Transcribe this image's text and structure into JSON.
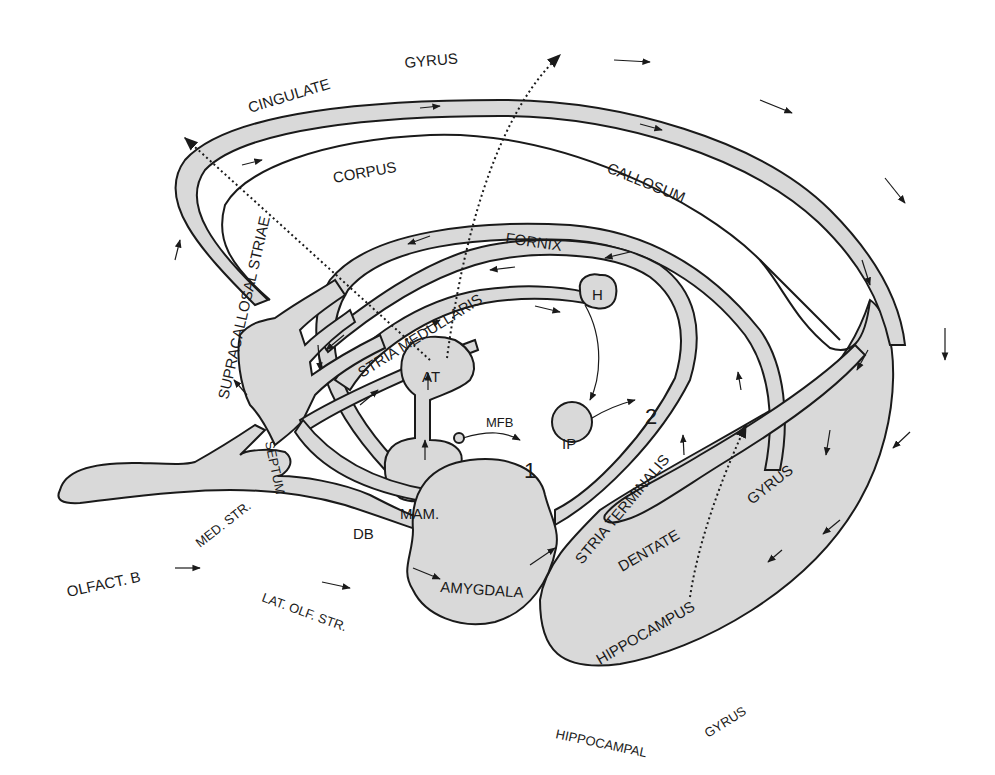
{
  "diagram": {
    "type": "anatomical-schematic",
    "labels": {
      "cingulate": "CINGULATE",
      "gyrus_top": "GYRUS",
      "corpus": "CORPUS",
      "callosum": "CALLOSUM",
      "fornix": "FORNIX",
      "stria_medullaris": "STRIA MEDULLARIS",
      "supracallosal_striae": "SUPRACALLOSAL STRIAE",
      "h": "H",
      "at": "AT",
      "mfb": "MFB",
      "ip": "IP",
      "num1": "1",
      "num2": "2",
      "septum": "SEPTUM",
      "mam": "MAM.",
      "db": "DB",
      "med_str": "MED. STR.",
      "olfact_b": "OLFACT. B",
      "lat_olf_str": "LAT. OLF. STR.",
      "amygdala": "AMYGDALA",
      "stria_terminalis": "STRIA TERMINALIS",
      "dentate": "DENTATE",
      "gyrus_dentate": "GYRUS",
      "hippocampus": "HIPPOCAMPUS",
      "hippocampal": "HIPPOCAMPAL",
      "gyrus_bottom": "GYRUS"
    },
    "colors": {
      "fill": "#d9d9d9",
      "stroke": "#1a1a1a",
      "background": "#ffffff"
    }
  }
}
